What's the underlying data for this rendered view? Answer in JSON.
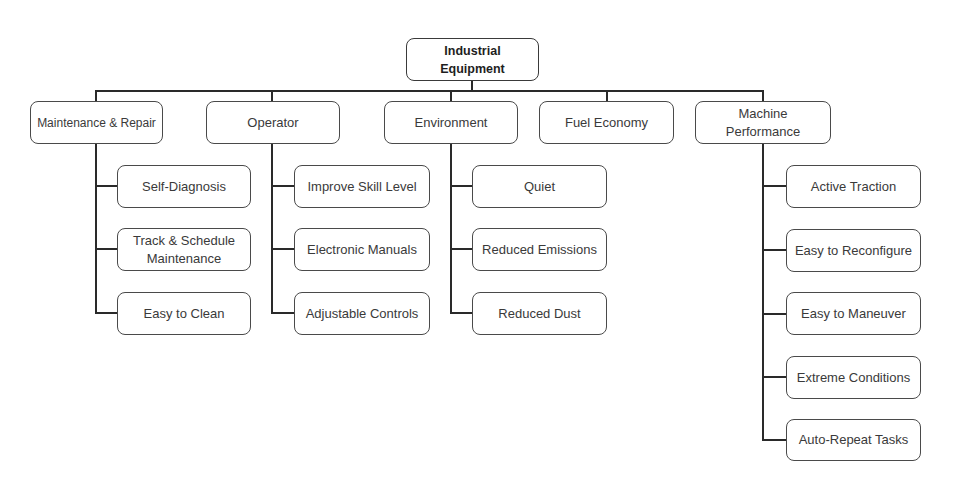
{
  "diagram": {
    "type": "hierarchy-tree",
    "colors": {
      "line": "#2a2a2a",
      "border": "#4a4a4a",
      "text": "#3a3a3a",
      "background": "#ffffff"
    },
    "root": {
      "label": "Industrial Equipment"
    },
    "categories": [
      {
        "label": "Maintenance & Repair",
        "children": [
          "Self-Diagnosis",
          "Track & Schedule Maintenance",
          "Easy to Clean"
        ]
      },
      {
        "label": "Operator",
        "children": [
          "Improve Skill Level",
          "Electronic Manuals",
          "Adjustable Controls"
        ]
      },
      {
        "label": "Environment",
        "children": [
          "Quiet",
          "Reduced Emissions",
          "Reduced Dust"
        ]
      },
      {
        "label": "Fuel Economy",
        "children": []
      },
      {
        "label": "Machine Performance",
        "children": [
          "Active Traction",
          "Easy to Reconfigure",
          "Easy to Maneuver",
          "Extreme Conditions",
          "Auto-Repeat Tasks"
        ]
      }
    ]
  }
}
